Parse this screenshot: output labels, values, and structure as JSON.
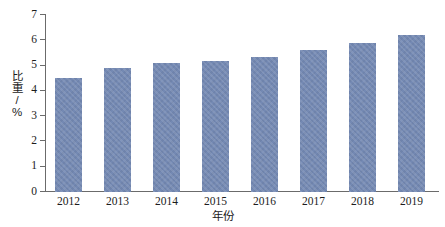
{
  "chart_data": {
    "type": "bar",
    "title": "",
    "subtitle": "",
    "xlabel": "年份",
    "ylabel": "比重/%",
    "categories": [
      "2012",
      "2013",
      "2014",
      "2015",
      "2016",
      "2017",
      "2018",
      "2019"
    ],
    "values": [
      4.5,
      4.9,
      5.1,
      5.2,
      5.35,
      5.6,
      5.9,
      6.2
    ],
    "series": [
      {
        "name": "比重/%",
        "values": [
          4.5,
          4.9,
          5.1,
          5.2,
          5.35,
          5.6,
          5.9,
          6.2
        ]
      }
    ],
    "ylim": [
      0,
      7
    ],
    "ytick_labels": [
      "0",
      "1",
      "2",
      "3",
      "4",
      "5",
      "6",
      "7"
    ],
    "ytick_values": [
      0,
      1,
      2,
      3,
      4,
      5,
      6,
      7
    ],
    "xtick_labels": [
      "2012",
      "2013",
      "2014",
      "2015",
      "2016",
      "2017",
      "2018",
      "2019"
    ],
    "grid": false,
    "legend": false,
    "legend_position": "none",
    "bar_color": "#7489b3",
    "axis_color": "#6b6b6b",
    "text_color": "#1c1c1c",
    "background_color": "#ffffff"
  },
  "axes": {
    "y_title": "比重/%",
    "x_title": "年份"
  }
}
